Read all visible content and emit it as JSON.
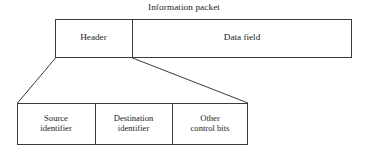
{
  "figure": {
    "caption": "Information packet",
    "background_color": "#ffffff",
    "stroke_color": "#3a3a3a"
  },
  "packet": {
    "fields": [
      {
        "label": "Header"
      },
      {
        "label": "Data field"
      }
    ]
  },
  "header_detail": {
    "fields": [
      {
        "label": "Source\nidentifier"
      },
      {
        "label": "Destination\nidentifier"
      },
      {
        "label": "Other\ncontrol bits"
      }
    ]
  },
  "geometry": {
    "packet_box": {
      "x": 55,
      "y": 19,
      "width": 297,
      "height": 39,
      "divider_x": 132
    },
    "detail_box": {
      "x": 17,
      "y": 103,
      "width": 231,
      "height": 42,
      "divider_x1": 95,
      "divider_x2": 172
    },
    "leader_left": {
      "x1": 55,
      "y1": 58,
      "x2": 17,
      "y2": 103
    },
    "leader_right": {
      "x1": 132,
      "y1": 58,
      "x2": 248,
      "y2": 103
    }
  }
}
